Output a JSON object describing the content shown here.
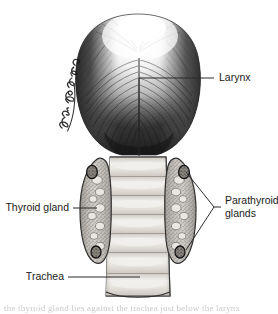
{
  "figure": {
    "background_color": "#ffffff",
    "ink_color": "#2b2b2b",
    "label_color": "#1a1a1a",
    "width": 278,
    "height": 314
  },
  "labels": {
    "larynx": "Larynx",
    "thyroid_gland": "Thyroid gland",
    "parathyroid_glands_line1": "Parathyroid",
    "parathyroid_glands_line2": "glands",
    "trachea": "Trachea"
  },
  "artist": {
    "signature": "Dan E. Christensen",
    "orientation": "vertical"
  },
  "structures": {
    "larynx": {
      "name": "Larynx",
      "description": "Large bulbous muscular mass with radiating hatched strokes, bright top highlight, dark lateral borders and a vertical midline groove",
      "shading": "hatched"
    },
    "thyroid_gland": {
      "name": "Thyroid gland",
      "description": "Two elongated stippled lateral lobes flanking the trachea",
      "lobes": 2,
      "texture": "stippled"
    },
    "parathyroid_glands": {
      "name": "Parathyroid glands",
      "description": "Small dark oval glands embedded in the superior and inferior poles of each thyroid lobe",
      "count": 4,
      "visible_marked": 2
    },
    "trachea": {
      "name": "Trachea",
      "description": "Vertical tube of stacked cartilage rings with highlighted centers",
      "rings": 7
    }
  },
  "caption": {
    "bottom_partial_text": "the thyroid gland lies against the trachea just below the larynx"
  }
}
